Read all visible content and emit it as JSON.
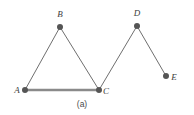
{
  "figure": {
    "caption": "(a)",
    "caption_position": {
      "x": 82,
      "y": 107
    },
    "background_color": "#ffffff",
    "node_color": "#555555",
    "edge_color": "#6f6f6f",
    "highlight_edge_color": "#8a8a8a",
    "label_color": "#3d3d3d"
  },
  "chart_data": {
    "type": "diagram",
    "title": "(a)",
    "nodes": [
      {
        "id": "A",
        "label": "A",
        "x": 25,
        "y": 90,
        "label_x": 17,
        "label_y": 93,
        "radius": 3
      },
      {
        "id": "B",
        "label": "B",
        "x": 60,
        "y": 27,
        "label_x": 60,
        "label_y": 17,
        "radius": 3
      },
      {
        "id": "C",
        "label": "C",
        "x": 99,
        "y": 90,
        "label_x": 106,
        "label_y": 94,
        "radius": 3
      },
      {
        "id": "D",
        "label": "D",
        "x": 137,
        "y": 26,
        "label_x": 137,
        "label_y": 16,
        "radius": 3
      },
      {
        "id": "E",
        "label": "E",
        "x": 166,
        "y": 76,
        "label_x": 174,
        "label_y": 80,
        "radius": 3
      }
    ],
    "edges": [
      {
        "id": "A-B",
        "from": "A",
        "to": "B",
        "x1": 25,
        "y1": 90,
        "x2": 60,
        "y2": 27,
        "width": 1,
        "color": "#6f6f6f"
      },
      {
        "id": "B-C",
        "from": "B",
        "to": "C",
        "x1": 60,
        "y1": 27,
        "x2": 99,
        "y2": 90,
        "width": 1,
        "color": "#6f6f6f"
      },
      {
        "id": "A-C",
        "from": "A",
        "to": "C",
        "x1": 25,
        "y1": 90,
        "x2": 99,
        "y2": 90,
        "width": 2.4,
        "color": "#8a8a8a"
      },
      {
        "id": "C-D",
        "from": "C",
        "to": "D",
        "x1": 99,
        "y1": 90,
        "x2": 137,
        "y2": 26,
        "width": 1,
        "color": "#6f6f6f"
      },
      {
        "id": "D-E",
        "from": "D",
        "to": "E",
        "x1": 137,
        "y1": 26,
        "x2": 166,
        "y2": 76,
        "width": 1,
        "color": "#6f6f6f"
      }
    ],
    "xlabel": "",
    "ylabel": "",
    "grid": false,
    "legend": false
  }
}
